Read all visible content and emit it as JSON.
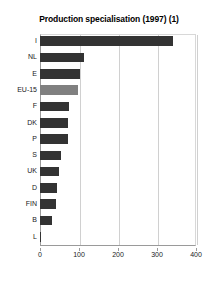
{
  "chart_data": {
    "type": "bar",
    "orientation": "horizontal",
    "title": "Production specialisation (1997) (1)",
    "xlabel": "",
    "ylabel": "",
    "categories": [
      "I",
      "NL",
      "E",
      "EU-15",
      "F",
      "DK",
      "P",
      "S",
      "UK",
      "D",
      "FIN",
      "B",
      "L"
    ],
    "values": [
      340,
      113,
      102,
      97,
      75,
      73,
      71,
      54,
      49,
      44,
      41,
      31,
      2
    ],
    "highlight_category": "EU-15",
    "xlim": [
      0,
      400
    ],
    "xticks": [
      0,
      100,
      200,
      300,
      400
    ],
    "xtick_labels": [
      "0",
      "100",
      "200",
      "300",
      "400"
    ],
    "grid": true,
    "grid_axis": "x",
    "legend": null,
    "bar_color": "#333333",
    "highlight_color": "#808080",
    "background_color": "#ffffff"
  }
}
